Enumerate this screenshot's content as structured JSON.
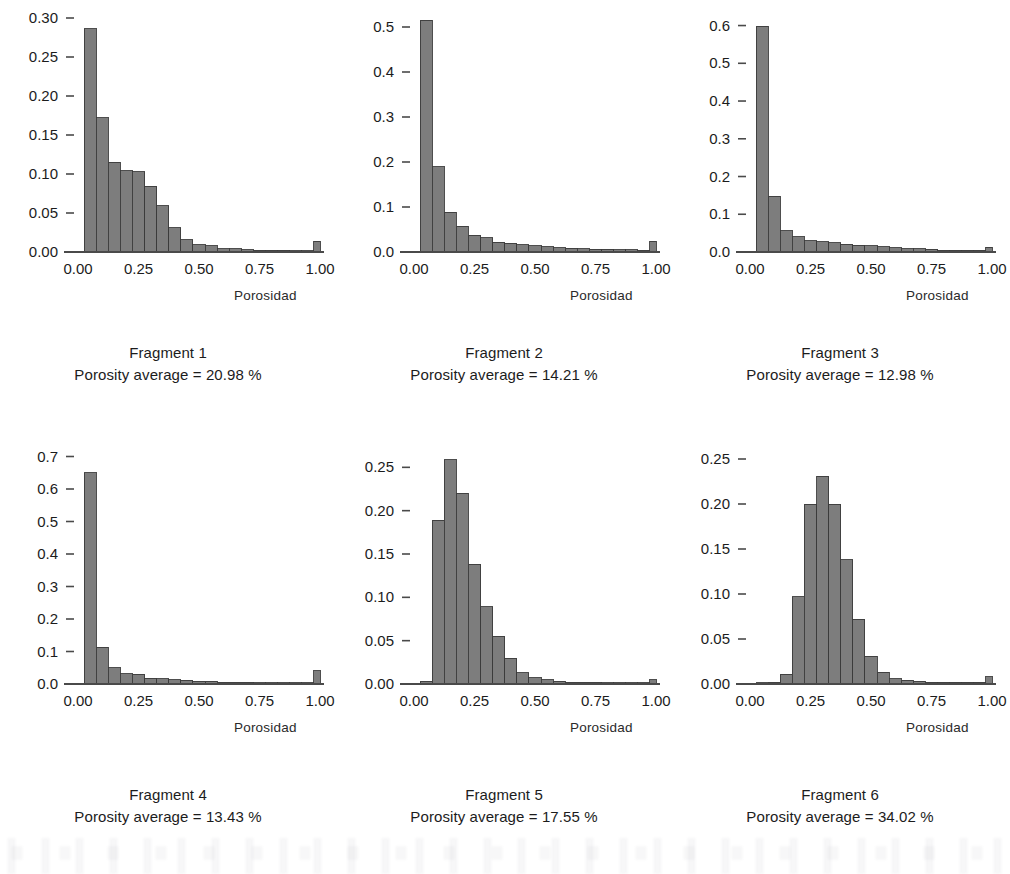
{
  "figure": {
    "background_color": "#ffffff",
    "bar_fill_color": "#7d7d7d",
    "bar_edge_color": "#3b3b3b",
    "axis_color": "#4a4a4a",
    "text_color": "#1c1c1c",
    "panel_count": 6,
    "columns": 3,
    "rows": 2
  },
  "common": {
    "xlabel": "Porosidad",
    "xtick_labels": [
      "0.00",
      "0.25",
      "0.50",
      "0.75",
      "1.00"
    ],
    "xticks": [
      0,
      0.25,
      0.5,
      0.75,
      1.0
    ],
    "xlim": [
      0,
      1
    ],
    "caption_prefix": "Fragment",
    "caption_metric_label": "Porosity average =",
    "caption_metric_unit": "%"
  },
  "chart_data": [
    {
      "type": "bar",
      "title": "Fragment 1",
      "annotation": "Porosity average = 20.98 %",
      "xlabel": "Porosidad",
      "ylabel": "",
      "xlim": [
        0,
        1
      ],
      "ylim": [
        0,
        0.3
      ],
      "grid": false,
      "legend": "none",
      "ytick_labels": [
        "0.00",
        "0.05",
        "0.10",
        "0.15",
        "0.20",
        "0.25",
        "0.30"
      ],
      "yticks": [
        0,
        0.05,
        0.1,
        0.15,
        0.2,
        0.25,
        0.3
      ],
      "bin_width": 0.05,
      "bin_edges": [
        0.025,
        0.075,
        0.125,
        0.175,
        0.225,
        0.275,
        0.325,
        0.375,
        0.425,
        0.475,
        0.525,
        0.575,
        0.625,
        0.675,
        0.725,
        0.775,
        0.825,
        0.875,
        0.925,
        0.975,
        1.025
      ],
      "values": [
        0.286,
        0.172,
        0.115,
        0.104,
        0.103,
        0.084,
        0.059,
        0.031,
        0.016,
        0.009,
        0.008,
        0.004,
        0.004,
        0.003,
        0.002,
        0.002,
        0.002,
        0.001,
        0.001,
        0.014
      ]
    },
    {
      "type": "bar",
      "title": "Fragment  2",
      "annotation": "Porosity average = 14.21 %",
      "xlabel": "Porosidad",
      "ylabel": "",
      "xlim": [
        0,
        1
      ],
      "ylim": [
        0,
        0.52
      ],
      "grid": false,
      "legend": "none",
      "ytick_labels": [
        "0.0",
        "0.1",
        "0.2",
        "0.3",
        "0.4",
        "0.5"
      ],
      "yticks": [
        0,
        0.1,
        0.2,
        0.3,
        0.4,
        0.5
      ],
      "bin_width": 0.05,
      "bin_edges": [
        0.025,
        0.075,
        0.125,
        0.175,
        0.225,
        0.275,
        0.325,
        0.375,
        0.425,
        0.475,
        0.525,
        0.575,
        0.625,
        0.675,
        0.725,
        0.775,
        0.825,
        0.875,
        0.925,
        0.975,
        1.025
      ],
      "values": [
        0.515,
        0.19,
        0.088,
        0.057,
        0.037,
        0.032,
        0.022,
        0.019,
        0.016,
        0.014,
        0.012,
        0.01,
        0.008,
        0.007,
        0.006,
        0.006,
        0.005,
        0.005,
        0.004,
        0.024
      ]
    },
    {
      "type": "bar",
      "title": "Fragment 3",
      "annotation": "Porosity average = 12.98 %",
      "xlabel": "Porosidad",
      "ylabel": "",
      "xlim": [
        0,
        1
      ],
      "ylim": [
        0,
        0.62
      ],
      "grid": false,
      "legend": "none",
      "ytick_labels": [
        "0.0",
        "0.1",
        "0.2",
        "0.3",
        "0.4",
        "0.5",
        "0.6"
      ],
      "yticks": [
        0,
        0.1,
        0.2,
        0.3,
        0.4,
        0.5,
        0.6
      ],
      "bin_width": 0.05,
      "bin_edges": [
        0.025,
        0.075,
        0.125,
        0.175,
        0.225,
        0.275,
        0.325,
        0.375,
        0.425,
        0.475,
        0.525,
        0.575,
        0.625,
        0.675,
        0.725,
        0.775,
        0.825,
        0.875,
        0.925,
        0.975,
        1.025
      ],
      "values": [
        0.598,
        0.148,
        0.056,
        0.04,
        0.03,
        0.027,
        0.024,
        0.02,
        0.018,
        0.016,
        0.014,
        0.011,
        0.009,
        0.008,
        0.007,
        0.005,
        0.005,
        0.004,
        0.004,
        0.013
      ]
    },
    {
      "type": "bar",
      "title": "Fragment 4",
      "annotation": "Porosity average = 13.43 %",
      "xlabel": "Porosidad",
      "ylabel": "",
      "xlim": [
        0,
        1
      ],
      "ylim": [
        0,
        0.72
      ],
      "grid": false,
      "legend": "none",
      "ytick_labels": [
        "0.0",
        "0.1",
        "0.2",
        "0.3",
        "0.4",
        "0.5",
        "0.6",
        "0.7"
      ],
      "yticks": [
        0,
        0.1,
        0.2,
        0.3,
        0.4,
        0.5,
        0.6,
        0.7
      ],
      "bin_width": 0.05,
      "bin_edges": [
        0.025,
        0.075,
        0.125,
        0.175,
        0.225,
        0.275,
        0.325,
        0.375,
        0.425,
        0.475,
        0.525,
        0.575,
        0.625,
        0.675,
        0.725,
        0.775,
        0.825,
        0.875,
        0.925,
        0.975,
        1.025
      ],
      "values": [
        0.65,
        0.113,
        0.05,
        0.032,
        0.03,
        0.018,
        0.016,
        0.013,
        0.011,
        0.009,
        0.008,
        0.006,
        0.006,
        0.005,
        0.004,
        0.004,
        0.003,
        0.003,
        0.003,
        0.041
      ]
    },
    {
      "type": "bar",
      "title": "Fragment 5",
      "annotation": "Porosity average = 17.55 %",
      "xlabel": "Porosidad",
      "ylabel": "",
      "xlim": [
        0,
        1
      ],
      "ylim": [
        0,
        0.27
      ],
      "grid": false,
      "legend": "none",
      "ytick_labels": [
        "0.00",
        "0.05",
        "0.10",
        "0.15",
        "0.20",
        "0.25"
      ],
      "yticks": [
        0,
        0.05,
        0.1,
        0.15,
        0.2,
        0.25
      ],
      "bin_width": 0.05,
      "bin_edges": [
        0.025,
        0.075,
        0.125,
        0.175,
        0.225,
        0.275,
        0.325,
        0.375,
        0.425,
        0.475,
        0.525,
        0.575,
        0.625,
        0.675,
        0.725,
        0.775,
        0.825,
        0.875,
        0.925,
        0.975,
        1.025
      ],
      "values": [
        0.003,
        0.189,
        0.259,
        0.22,
        0.138,
        0.089,
        0.055,
        0.03,
        0.013,
        0.007,
        0.005,
        0.003,
        0.002,
        0.002,
        0.002,
        0.001,
        0.001,
        0.001,
        0.001,
        0.005
      ]
    },
    {
      "type": "bar",
      "title": "Fragment 6",
      "annotation": "Porosity average = 34.02 %",
      "xlabel": "Porosidad",
      "ylabel": "",
      "xlim": [
        0,
        1
      ],
      "ylim": [
        0,
        0.26
      ],
      "grid": false,
      "legend": "none",
      "ytick_labels": [
        "0.00",
        "0.05",
        "0.10",
        "0.15",
        "0.20",
        "0.25"
      ],
      "yticks": [
        0,
        0.05,
        0.1,
        0.15,
        0.2,
        0.25
      ],
      "bin_width": 0.05,
      "bin_edges": [
        0.025,
        0.075,
        0.125,
        0.175,
        0.225,
        0.275,
        0.325,
        0.375,
        0.425,
        0.475,
        0.525,
        0.575,
        0.625,
        0.675,
        0.725,
        0.775,
        0.825,
        0.875,
        0.925,
        0.975,
        1.025
      ],
      "values": [
        0.001,
        0.002,
        0.011,
        0.097,
        0.2,
        0.231,
        0.2,
        0.138,
        0.072,
        0.031,
        0.013,
        0.006,
        0.004,
        0.003,
        0.002,
        0.002,
        0.002,
        0.002,
        0.002,
        0.008
      ]
    }
  ]
}
